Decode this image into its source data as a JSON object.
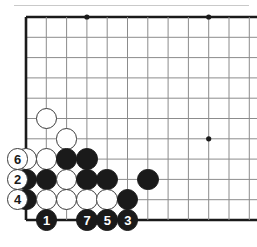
{
  "diagram": {
    "type": "go-board-diagram",
    "title": "",
    "board": {
      "grid_spacing": 20.3,
      "origin_x": 26,
      "origin_y": 17,
      "cols": 12,
      "rows": 10,
      "line_color": "#8c8c8c",
      "edge_color": "#1a1a1a",
      "background": "#ffffff"
    },
    "star_points": [
      {
        "col": 3,
        "row": 0
      },
      {
        "col": 9,
        "row": 0
      },
      {
        "col": 9,
        "row": 6
      }
    ],
    "stones": [
      {
        "id": "w-c1r5",
        "color": "white",
        "col": 1,
        "row": 5,
        "label": ""
      },
      {
        "id": "w-c2r6",
        "color": "white",
        "col": 2,
        "row": 6,
        "label": ""
      },
      {
        "id": "w-c0r7",
        "color": "white",
        "col": 0,
        "row": 7,
        "label": ""
      },
      {
        "id": "w-c1r7",
        "color": "white",
        "col": 1,
        "row": 7,
        "label": ""
      },
      {
        "id": "b-c2r7",
        "color": "black",
        "col": 2,
        "row": 7,
        "label": ""
      },
      {
        "id": "b-c3r7",
        "color": "black",
        "col": 3,
        "row": 7,
        "label": ""
      },
      {
        "id": "b-c0r8",
        "color": "black",
        "col": 0,
        "row": 8,
        "label": ""
      },
      {
        "id": "b-c1r8",
        "color": "black",
        "col": 1,
        "row": 8,
        "label": ""
      },
      {
        "id": "w-c2r8",
        "color": "white",
        "col": 2,
        "row": 8,
        "label": ""
      },
      {
        "id": "b-c3r8",
        "color": "black",
        "col": 3,
        "row": 8,
        "label": ""
      },
      {
        "id": "b-c4r8",
        "color": "black",
        "col": 4,
        "row": 8,
        "label": ""
      },
      {
        "id": "b-c6r8",
        "color": "black",
        "col": 6,
        "row": 8,
        "label": ""
      },
      {
        "id": "b-c0r9",
        "color": "black",
        "col": 0,
        "row": 9,
        "label": ""
      },
      {
        "id": "w-c1r9",
        "color": "white",
        "col": 1,
        "row": 9,
        "label": ""
      },
      {
        "id": "w-c2r9",
        "color": "white",
        "col": 2,
        "row": 9,
        "label": ""
      },
      {
        "id": "w-c3r9",
        "color": "white",
        "col": 3,
        "row": 9,
        "label": ""
      },
      {
        "id": "w-c4r9",
        "color": "white",
        "col": 4,
        "row": 9,
        "label": ""
      },
      {
        "id": "b-c5r9",
        "color": "black",
        "col": 5,
        "row": 9,
        "label": ""
      },
      {
        "id": "b-move-1",
        "color": "black",
        "col": 1,
        "row": 10,
        "label": "1"
      },
      {
        "id": "b-move-7",
        "color": "black",
        "col": 3,
        "row": 10,
        "label": "7"
      },
      {
        "id": "b-move-5",
        "color": "black",
        "col": 4,
        "row": 10,
        "label": "5"
      },
      {
        "id": "b-move-3",
        "color": "black",
        "col": 5,
        "row": 10,
        "label": "3"
      },
      {
        "id": "w-move-6",
        "color": "white",
        "col": -0.42,
        "row": 7,
        "label": "6"
      },
      {
        "id": "w-move-2",
        "color": "white",
        "col": -0.42,
        "row": 8,
        "label": "2"
      },
      {
        "id": "w-move-4",
        "color": "white",
        "col": -0.42,
        "row": 9,
        "label": "4"
      }
    ],
    "move_sequence": {
      "black_moves": [
        "1",
        "3",
        "5",
        "7"
      ],
      "white_moves": [
        "2",
        "4",
        "6"
      ]
    }
  }
}
